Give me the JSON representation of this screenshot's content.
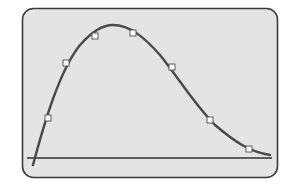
{
  "chart_data": {
    "type": "line",
    "title": "",
    "xlabel": "",
    "ylabel": "",
    "grid": false,
    "legend": null,
    "series": [
      {
        "name": "curve",
        "markers": "square",
        "points": [
          {
            "x": 48,
            "y": 118
          },
          {
            "x": 66,
            "y": 63
          },
          {
            "x": 95,
            "y": 36
          },
          {
            "x": 133,
            "y": 33
          },
          {
            "x": 172,
            "y": 67
          },
          {
            "x": 210,
            "y": 120
          },
          {
            "x": 249,
            "y": 149
          }
        ]
      }
    ],
    "curve_path_px": "M33,165 C45,120 60,70 80,45 C95,28 105,25 113,25 C130,25 145,38 160,55 C180,80 195,105 215,125 C235,142 250,152 270,155",
    "baseline_y_px": 158,
    "colors": {
      "panel_fill": "#e4e4e4",
      "panel_border": "#3a3a3a",
      "curve": "#4a4a4a",
      "baseline": "#2e2e2e",
      "marker_fill": "#ffffff",
      "marker_stroke": "#5a5a5a"
    }
  }
}
